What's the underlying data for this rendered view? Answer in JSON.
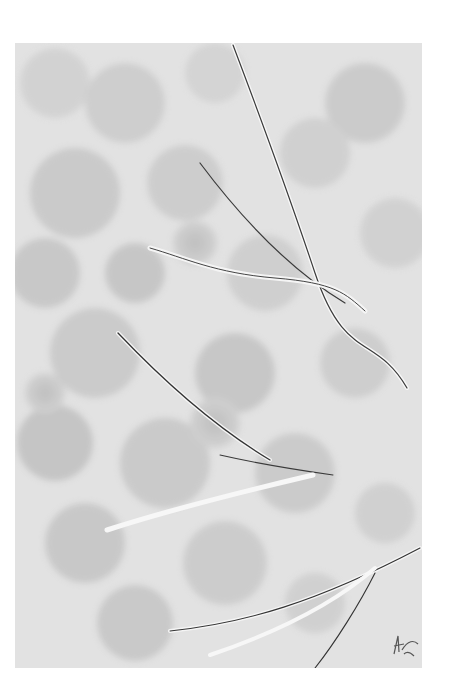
{
  "artwork": {
    "subject": "grayscale painting of thin branches over soft overlapping circular leaf shapes",
    "palette": {
      "background": "#ffffff",
      "base": "#e4e4e4",
      "blob_light": "#d6d6d6",
      "blob_dark": "#b8b8b8",
      "branch_dark": "#3a3a3a",
      "branch_light": "#f6f6f6"
    },
    "signature_present": true
  }
}
